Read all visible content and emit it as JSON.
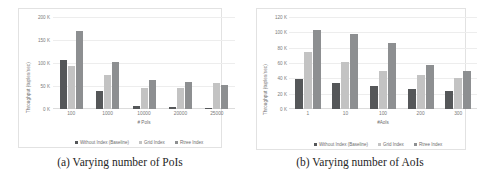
{
  "figure": {
    "panels": [
      {
        "id": "panel-a",
        "caption": "(a) Varying number of PoIs",
        "chart_data": {
          "type": "bar",
          "title": "",
          "xlabel": "# PoIs",
          "ylabel": "Throughput (tuples/sec)",
          "categories": [
            "100",
            "1000",
            "10000",
            "20000",
            "25000"
          ],
          "series": [
            {
              "name": "Without Index (Baseline)",
              "color": "#555759",
              "values": [
                107000,
                40000,
                7000,
                4000,
                3000
              ]
            },
            {
              "name": "Grid Index",
              "color": "#c3c3c3",
              "values": [
                93000,
                75000,
                45000,
                46000,
                56000
              ]
            },
            {
              "name": "Rtree Index",
              "color": "#8d8f91",
              "values": [
                170000,
                102000,
                62000,
                58000,
                52000
              ]
            }
          ],
          "ylim": [
            0,
            200000
          ],
          "yticks": [
            0,
            50000,
            100000,
            150000,
            200000
          ],
          "ytick_labels": [
            "0 K",
            "50 K",
            "100 K",
            "150 K",
            "200 K"
          ],
          "grid": true,
          "legend_position": "bottom"
        }
      },
      {
        "id": "panel-b",
        "caption": "(b) Varying number of AoIs",
        "chart_data": {
          "type": "bar",
          "title": "",
          "xlabel": "#AoIs",
          "ylabel": "Throughput (tuples/sec)",
          "categories": [
            "1",
            "10",
            "100",
            "200",
            "300"
          ],
          "series": [
            {
              "name": "Without Index (Baseline)",
              "color": "#555759",
              "values": [
                39000,
                34000,
                30000,
                26000,
                24000
              ]
            },
            {
              "name": "Grid Index",
              "color": "#c3c3c3",
              "values": [
                75000,
                61000,
                50000,
                45000,
                41000
              ]
            },
            {
              "name": "Rtree Index",
              "color": "#8d8f91",
              "values": [
                103000,
                98000,
                86000,
                58000,
                49000
              ]
            }
          ],
          "ylim": [
            0,
            120000
          ],
          "yticks": [
            0,
            20000,
            40000,
            60000,
            80000,
            100000,
            120000
          ],
          "ytick_labels": [
            "0 K",
            "20 K",
            "40 K",
            "60 K",
            "80 K",
            "100 K",
            "120 K"
          ],
          "grid": true,
          "legend_position": "bottom"
        }
      }
    ]
  }
}
